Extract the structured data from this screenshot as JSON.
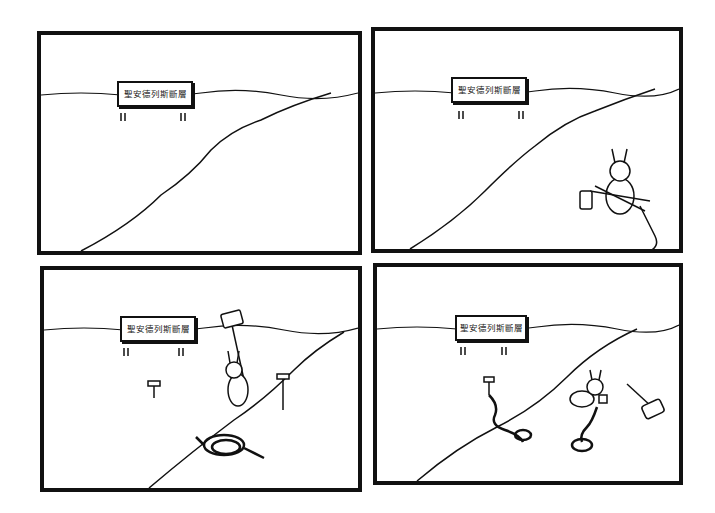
{
  "comic": {
    "panels": [
      {
        "id": 1,
        "sign_text": "聖安德列斯斷層",
        "description": "Empty landscape with sign and fault line"
      },
      {
        "id": 2,
        "sign_text": "聖安德列斯斷層",
        "description": "Rabbit carrying mallet, stakes and rope toward fault"
      },
      {
        "id": 3,
        "sign_text": "聖安德列斯斷層",
        "description": "Rabbit hammering stakes on both sides of the fault, rope coiled"
      },
      {
        "id": 4,
        "sign_text": "聖安德列斯斷層",
        "description": "Rabbit tying rope between stakes across the fault, mallet on ground"
      }
    ]
  },
  "colors": {
    "ink": "#111111",
    "paper": "#ffffff"
  }
}
